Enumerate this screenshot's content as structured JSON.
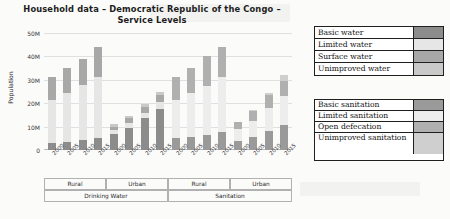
{
  "chart_data": {
    "type": "bar",
    "subtype": "stacked",
    "title": "Household data – Democratic Republic of the Congo – Service Levels",
    "xlabel": "",
    "ylabel": "Population",
    "ylim": [
      0,
      50000000
    ],
    "ytick_labels": [
      "0",
      "10M",
      "20M",
      "30M",
      "40M",
      "50M"
    ],
    "ytick_values": [
      0,
      10000000,
      20000000,
      30000000,
      40000000,
      50000000
    ],
    "grid": true,
    "legend_position": "right",
    "categories": [
      "2000",
      "2005",
      "2010",
      "2015",
      "2000",
      "2005",
      "2010",
      "2015",
      "2000",
      "2005",
      "2010",
      "2015",
      "2000",
      "2005",
      "2010",
      "2015"
    ],
    "group_level_1": [
      {
        "label": "Rural",
        "span": 4
      },
      {
        "label": "Urban",
        "span": 4
      },
      {
        "label": "Rural",
        "span": 4
      },
      {
        "label": "Urban",
        "span": 4
      }
    ],
    "group_level_2": [
      {
        "label": "Drinking Water",
        "span": 8
      },
      {
        "label": "Sanitation",
        "span": 8
      }
    ],
    "series": [
      {
        "name": "Basic water",
        "color": "#8c8c8c",
        "values": [
          3000000,
          3500000,
          4200000,
          5200000,
          7000000,
          9500000,
          13500000,
          17500000,
          null,
          null,
          null,
          null,
          null,
          null,
          null,
          null
        ]
      },
      {
        "name": "Limited water",
        "color": "#e6e6e6",
        "values": [
          18500000,
          21000000,
          23500000,
          26000000,
          1500000,
          2000000,
          2500000,
          3000000,
          null,
          null,
          null,
          null,
          null,
          null,
          null,
          null
        ]
      },
      {
        "name": "Surface water",
        "color": "#a8a8a8",
        "values": [
          9500000,
          10500000,
          11300000,
          12800000,
          1500000,
          2000000,
          2400000,
          3000000,
          null,
          null,
          null,
          null,
          null,
          null,
          null,
          null
        ]
      },
      {
        "name": "Unimproved water",
        "color": "#c9c9c9",
        "values": [
          0,
          0,
          0,
          0,
          1000000,
          1000000,
          1200000,
          1500000,
          null,
          null,
          null,
          null,
          null,
          null,
          null,
          null
        ]
      },
      {
        "name": "Basic sanitation",
        "color": "#9a9a9a",
        "values": [
          null,
          null,
          null,
          null,
          null,
          null,
          null,
          null,
          5000000,
          5700000,
          6500000,
          7500000,
          4000000,
          5500000,
          8000000,
          10500000
        ]
      },
      {
        "name": "Limited sanitation",
        "color": "#ededed",
        "values": [
          null,
          null,
          null,
          null,
          null,
          null,
          null,
          null,
          16500000,
          18500000,
          21000000,
          23500000,
          5000000,
          7000000,
          10000000,
          12500000
        ]
      },
      {
        "name": "Open defecation",
        "color": "#b0b0b0",
        "values": [
          null,
          null,
          null,
          null,
          null,
          null,
          null,
          null,
          9500000,
          11000000,
          12500000,
          13000000,
          3000000,
          4000000,
          5500000,
          6500000
        ]
      },
      {
        "name": "Unimproved sanitation",
        "color": "#cfcfcf",
        "values": [
          null,
          null,
          null,
          null,
          null,
          null,
          null,
          null,
          0,
          0,
          0,
          0,
          0,
          500000,
          1000000,
          2500000
        ]
      }
    ],
    "bar_totals": [
      31000000,
      35000000,
      39000000,
      44000000,
      11000000,
      14500000,
      19600000,
      25000000,
      31000000,
      35200000,
      40000000,
      44000000,
      12000000,
      17000000,
      24500000,
      32000000
    ]
  },
  "legends": [
    {
      "name": "water-legend",
      "rows": [
        {
          "label": "Basic water",
          "color": "#8c8c8c"
        },
        {
          "label": "Limited water",
          "color": "#e6e6e6"
        },
        {
          "label": "Surface water",
          "color": "#a8a8a8"
        },
        {
          "label": "Unimproved water",
          "color": "#c9c9c9"
        }
      ]
    },
    {
      "name": "sanitation-legend",
      "rows": [
        {
          "label": "Basic sanitation",
          "color": "#9a9a9a"
        },
        {
          "label": "Limited sanitation",
          "color": "#ededed"
        },
        {
          "label": "Open defecation",
          "color": "#b0b0b0"
        },
        {
          "label": "Unimproved sanitation",
          "color": "#cfcfcf"
        }
      ]
    }
  ]
}
